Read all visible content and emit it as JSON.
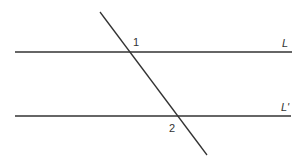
{
  "diagram": {
    "lines": {
      "L": {
        "label": "L",
        "x1": 15,
        "y1": 52,
        "x2": 292,
        "y2": 52
      },
      "L_prime": {
        "label": "L'",
        "x1": 15,
        "y1": 116,
        "x2": 291,
        "y2": 116
      },
      "transversal": {
        "x1": 100,
        "y1": 12,
        "x2": 207,
        "y2": 155
      }
    },
    "angles": [
      {
        "label": "1"
      },
      {
        "label": "2"
      }
    ],
    "colors": {
      "stroke": "#333333",
      "background": "#ffffff"
    }
  }
}
